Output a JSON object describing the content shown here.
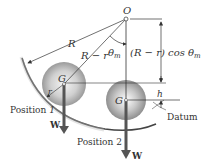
{
  "diagram": {
    "labels": {
      "origin": "O",
      "radius": "R",
      "radius_minus_r": "R − r",
      "theta": "θ",
      "theta_sub": "m",
      "height_expr": "(R − r) cos θ",
      "height_expr_sub": "m",
      "small_r": "r",
      "center_1": "G",
      "center_2": "G",
      "h": "h",
      "datum": "Datum",
      "position_1": "Position ",
      "position_1_num": "1",
      "position_2": "Position 2",
      "weight_1": "W",
      "weight_2": "W"
    },
    "colors": {
      "line": "#333333",
      "arrow": "#555555",
      "bowl": "#444444"
    }
  }
}
